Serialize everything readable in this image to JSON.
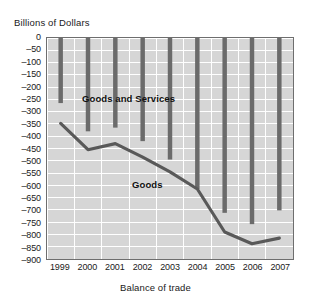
{
  "chart_data": {
    "type": "bar",
    "title": "Billions of Dollars",
    "xlabel": "Balance of trade",
    "ylabel": "",
    "categories": [
      "1999",
      "2000",
      "2001",
      "2002",
      "2003",
      "2004",
      "2005",
      "2006",
      "2007"
    ],
    "ylim": [
      -900,
      0
    ],
    "ytick_step": 50,
    "yticks": [
      "0",
      "–50",
      "–100",
      "–150",
      "–200",
      "–250",
      "–300",
      "–350",
      "–400",
      "–450",
      "–500",
      "–550",
      "–600",
      "–650",
      "–700",
      "–750",
      "–800",
      "–850",
      "–900"
    ],
    "ytick_values": [
      0,
      -50,
      -100,
      -150,
      -200,
      -250,
      -300,
      -350,
      -400,
      -450,
      -500,
      -550,
      -600,
      -650,
      -700,
      -750,
      -800,
      -850,
      -900
    ],
    "grid": true,
    "grid_color": "#ffffff",
    "plot_background": "#d6d6d6",
    "series": [
      {
        "name": "Goods and Services",
        "render": "bar",
        "color": "#6b6b6b",
        "values": [
          -265,
          -380,
          -365,
          -420,
          -495,
          -615,
          -712,
          -758,
          -702
        ]
      },
      {
        "name": "Goods",
        "render": "line",
        "color": "#595959",
        "values": [
          -348,
          -455,
          -430,
          -485,
          -545,
          -615,
          -790,
          -838,
          -815
        ]
      }
    ],
    "annotations": [
      {
        "text": "Goods and Services",
        "series": "Goods and Services"
      },
      {
        "text": "Goods",
        "series": "Goods"
      }
    ],
    "legend": "inline-annotations"
  }
}
